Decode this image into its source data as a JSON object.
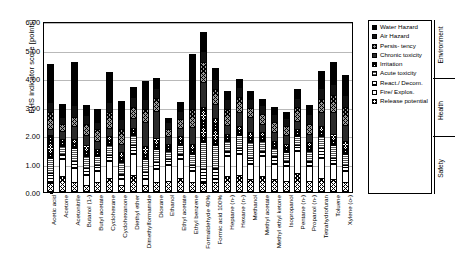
{
  "chart_data": {
    "type": "bar",
    "stacked": true,
    "title": "",
    "xlabel": "",
    "ylabel": "EHS indicator score [points]",
    "ylim": [
      0,
      6
    ],
    "ytick_labels": [
      "0.00",
      "1.00",
      "2.00",
      "3.00",
      "4.00",
      "5.00",
      "6.00"
    ],
    "ytick_values": [
      0,
      1,
      2,
      3,
      4,
      5,
      6
    ],
    "grid": true,
    "legend_position": "right",
    "categories": [
      "Acetic acid",
      "Acetone",
      "Acetonitrile",
      "Butanol (1-)",
      "Butyl acetate",
      "Cyclohexane",
      "Cyclohexanone",
      "Diethyl ether",
      "Dimethylformamide",
      "Dioxane",
      "Ethanol",
      "Ethyl acetate",
      "Ethyl benzene",
      "Formaldehyde 40%",
      "Formic acid 100%",
      "Heptane (n-)",
      "Hexane (n-)",
      "Methanol",
      "Methyl acetate",
      "Methyl ethyl ketone",
      "Isopropanol",
      "Pentane (n-)",
      "Propanol (n-)",
      "Tetrahydrofuran",
      "Toluene",
      "Xylene (o-)"
    ],
    "series": [
      {
        "name": "Release potential",
        "pattern": "cross-hatch",
        "values": [
          0.3,
          0.55,
          0.35,
          0.25,
          0.35,
          0.5,
          0.25,
          0.6,
          0.25,
          0.35,
          0.4,
          0.5,
          0.35,
          0.3,
          0.35,
          0.55,
          0.6,
          0.45,
          0.55,
          0.45,
          0.4,
          0.65,
          0.4,
          0.5,
          0.45,
          0.35
        ]
      },
      {
        "name": "Fire/Explos.",
        "pattern": "solid-white",
        "values": [
          0.05,
          0.6,
          0.5,
          0.35,
          0.4,
          0.6,
          0.2,
          0.75,
          0.2,
          0.45,
          0.55,
          0.65,
          0.4,
          0.05,
          0.1,
          0.7,
          0.75,
          0.55,
          0.7,
          0.55,
          0.5,
          0.8,
          0.5,
          0.7,
          0.55,
          0.4
        ]
      },
      {
        "name": "React./Decom.",
        "pattern": "horizontal-lines",
        "values": [
          0.3,
          0.2,
          0.25,
          0.25,
          0.2,
          0.2,
          0.2,
          0.3,
          0.25,
          0.25,
          0.2,
          0.2,
          0.2,
          0.45,
          0.4,
          0.2,
          0.2,
          0.2,
          0.2,
          0.25,
          0.2,
          0.2,
          0.2,
          0.35,
          0.2,
          0.2
        ]
      },
      {
        "name": "Acute toxicity",
        "pattern": "fine-horizontal",
        "values": [
          0.55,
          0.25,
          0.45,
          0.4,
          0.3,
          0.35,
          0.4,
          0.35,
          0.45,
          0.45,
          0.3,
          0.3,
          0.4,
          0.95,
          0.8,
          0.35,
          0.45,
          0.55,
          0.35,
          0.3,
          0.3,
          0.3,
          0.35,
          0.4,
          0.45,
          0.4
        ]
      },
      {
        "name": "Irritation",
        "pattern": "dense-cross-hatch",
        "values": [
          0.8,
          0.25,
          0.3,
          0.4,
          0.25,
          0.3,
          0.35,
          0.25,
          0.45,
          0.4,
          0.25,
          0.3,
          0.35,
          1.25,
          0.95,
          0.25,
          0.3,
          0.35,
          0.3,
          0.25,
          0.3,
          0.25,
          0.3,
          0.35,
          0.4,
          0.45
        ]
      },
      {
        "name": "Chronic toxicity",
        "pattern": "solid-dark",
        "values": [
          0.2,
          0.3,
          0.45,
          0.35,
          0.3,
          0.3,
          0.3,
          0.35,
          0.85,
          0.95,
          0.25,
          0.3,
          0.6,
          0.85,
          0.5,
          0.3,
          0.5,
          0.55,
          0.3,
          0.3,
          0.3,
          0.3,
          0.3,
          0.5,
          0.75,
          0.55
        ]
      },
      {
        "name": "Persistency",
        "pattern": "grey-cross-hatch",
        "values": [
          0.6,
          0.25,
          0.35,
          0.4,
          0.4,
          0.55,
          0.5,
          0.4,
          0.45,
          0.45,
          0.25,
          0.3,
          0.6,
          0.7,
          0.5,
          0.55,
          0.55,
          0.3,
          0.35,
          0.35,
          0.3,
          0.5,
          0.35,
          0.45,
          0.6,
          0.65
        ]
      },
      {
        "name": "Air Hazard",
        "pattern": "solid-black",
        "values": [
          0.35,
          0.25,
          0.4,
          0.3,
          0.25,
          0.35,
          0.35,
          0.35,
          0.35,
          0.35,
          0.25,
          0.3,
          0.35,
          0.4,
          0.35,
          0.35,
          0.35,
          0.3,
          0.3,
          0.3,
          0.3,
          0.3,
          0.35,
          0.4,
          0.4,
          0.4
        ]
      },
      {
        "name": "Water Hazard",
        "pattern": "solid-black",
        "values": [
          1.35,
          0.45,
          1.5,
          0.35,
          0.45,
          1.05,
          0.65,
          0.35,
          0.65,
          0.35,
          0.15,
          0.3,
          1.6,
          0.65,
          0.4,
          0.3,
          0.25,
          0.3,
          0.2,
          0.25,
          0.2,
          0.3,
          0.3,
          0.6,
          0.75,
          0.7
        ]
      }
    ],
    "totals": [
      4.5,
      3.1,
      4.55,
      3.05,
      2.9,
      4.2,
      3.2,
      3.7,
      3.9,
      4.0,
      2.6,
      3.15,
      4.85,
      5.6,
      4.35,
      3.55,
      3.95,
      3.55,
      3.25,
      3.0,
      2.8,
      3.6,
      3.05,
      4.25,
      4.55,
      4.1
    ],
    "group_brackets": [
      {
        "label": "Environment",
        "series": [
          "Water Hazard",
          "Air Hazard",
          "Persistency"
        ]
      },
      {
        "label": "Health",
        "series": [
          "Chronic toxicity",
          "Irritation",
          "Acute toxicity"
        ]
      },
      {
        "label": "Safety",
        "series": [
          "React./Decom.",
          "Fire/Explos.",
          "Release potential"
        ]
      }
    ],
    "legend_entries": [
      {
        "label": "Water Hazard",
        "class": "p-water"
      },
      {
        "label": "Air Hazard",
        "class": "p-air"
      },
      {
        "label": "Persis-\ntency",
        "class": "p-persistency"
      },
      {
        "label": "Chronic toxicity",
        "class": "p-chronic"
      },
      {
        "label": "Irritation",
        "class": "p-irritation"
      },
      {
        "label": "Acute toxicity",
        "class": "p-acute"
      },
      {
        "label": "React./ Decom.",
        "class": "p-react"
      },
      {
        "label": "Fire/ Explos.",
        "class": "p-fire"
      },
      {
        "label": "Release potential",
        "class": "p-release"
      }
    ]
  }
}
